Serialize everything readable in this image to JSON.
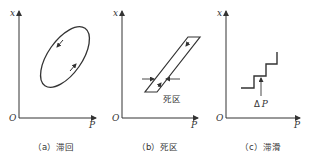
{
  "figure": {
    "stroke_color": "#333333",
    "background": "#ffffff",
    "panels": [
      {
        "id": "a",
        "caption": "（a）滞回",
        "y_axis_label": "x",
        "x_axis_label": "P",
        "origin_label": "O",
        "shape": "ellipse-loop",
        "arrows": [
          "down-left on upper branch",
          "up-right on lower branch"
        ]
      },
      {
        "id": "b",
        "caption": "（b）死区",
        "y_axis_label": "x",
        "x_axis_label": "P",
        "origin_label": "O",
        "shape": "parallelogram-band",
        "annotation": "死区"
      },
      {
        "id": "c",
        "caption": "（c）滞滑",
        "y_axis_label": "x",
        "x_axis_label": "P",
        "origin_label": "O",
        "shape": "staircase",
        "annotation_prefix": "Δ",
        "annotation_var": "P"
      }
    ]
  }
}
